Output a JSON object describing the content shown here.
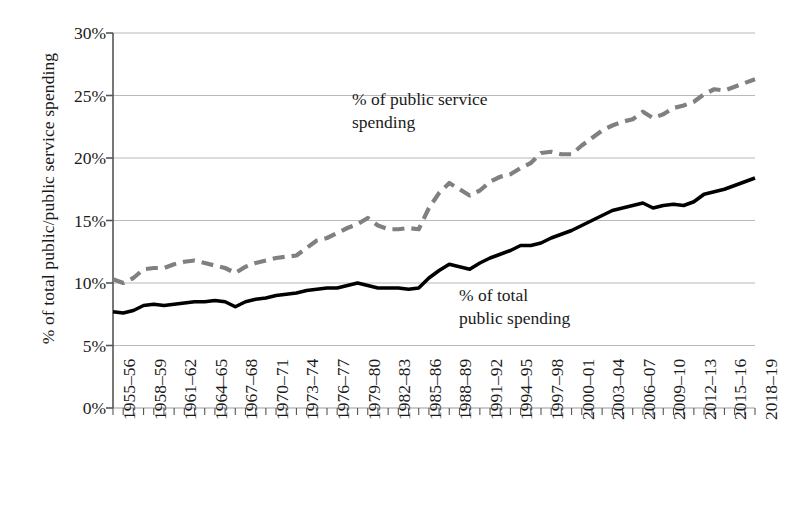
{
  "chart_data": {
    "type": "line",
    "title": "",
    "subtitle": "",
    "xlabel": "",
    "ylabel": "% of total public/public service spending",
    "ylim": [
      0,
      30
    ],
    "y_tick_labels": [
      "0%",
      "5%",
      "10%",
      "15%",
      "20%",
      "25%",
      "30%"
    ],
    "y_tick_values": [
      0,
      5,
      10,
      15,
      20,
      25,
      30
    ],
    "grid": "horizontal",
    "legend_position": "inline-annotations",
    "x_tick_labels": [
      "1955–56",
      "1958–59",
      "1961–62",
      "1964–65",
      "1967–68",
      "1970–71",
      "1973–74",
      "1976–77",
      "1979–80",
      "1982–83",
      "1985–86",
      "1988–89",
      "1991–92",
      "1994–95",
      "1997–98",
      "2000–01",
      "2003–04",
      "2006–07",
      "2009–10",
      "2012–13",
      "2015–16",
      "2018–19"
    ],
    "x_tick_indices": [
      0,
      3,
      6,
      9,
      12,
      15,
      18,
      21,
      24,
      27,
      30,
      33,
      36,
      39,
      42,
      45,
      48,
      51,
      54,
      57,
      60,
      63
    ],
    "x": [
      "1955-56",
      "1956-57",
      "1957-58",
      "1958-59",
      "1959-60",
      "1960-61",
      "1961-62",
      "1962-63",
      "1963-64",
      "1964-65",
      "1965-66",
      "1966-67",
      "1967-68",
      "1968-69",
      "1969-70",
      "1970-71",
      "1971-72",
      "1972-73",
      "1973-74",
      "1974-75",
      "1975-76",
      "1976-77",
      "1977-78",
      "1978-79",
      "1979-80",
      "1980-81",
      "1981-82",
      "1982-83",
      "1983-84",
      "1984-85",
      "1985-86",
      "1986-87",
      "1987-88",
      "1988-89",
      "1989-90",
      "1990-91",
      "1991-92",
      "1992-93",
      "1993-94",
      "1994-95",
      "1995-96",
      "1996-97",
      "1997-98",
      "1998-99",
      "1999-00",
      "2000-01",
      "2001-02",
      "2002-03",
      "2003-04",
      "2004-05",
      "2005-06",
      "2006-07",
      "2007-08",
      "2008-09",
      "2009-10",
      "2010-11",
      "2011-12",
      "2012-13",
      "2013-14",
      "2014-15",
      "2015-16",
      "2016-17",
      "2017-18",
      "2018-19"
    ],
    "series": [
      {
        "name": "% of public service spending",
        "style": "dashed",
        "color": "#808080",
        "values": [
          10.3,
          10.0,
          10.4,
          11.1,
          11.2,
          11.2,
          11.5,
          11.7,
          11.8,
          11.6,
          11.4,
          11.2,
          10.8,
          11.3,
          11.6,
          11.8,
          12.0,
          12.1,
          12.2,
          12.8,
          13.4,
          13.6,
          14.0,
          14.4,
          14.7,
          15.2,
          14.6,
          14.3,
          14.3,
          14.4,
          14.3,
          16.0,
          17.2,
          18.0,
          17.5,
          17.0,
          17.4,
          18.1,
          18.5,
          18.7,
          19.2,
          19.6,
          20.4,
          20.5,
          20.3,
          20.3,
          21.0,
          21.6,
          22.2,
          22.6,
          22.9,
          23.1,
          23.7,
          23.2,
          23.5,
          24.0,
          24.2,
          24.5,
          25.1,
          25.5,
          25.4,
          25.7,
          26.0,
          26.3
        ]
      },
      {
        "name": "% of total public spending",
        "style": "solid",
        "color": "#000000",
        "values": [
          7.7,
          7.6,
          7.8,
          8.2,
          8.3,
          8.2,
          8.3,
          8.4,
          8.5,
          8.5,
          8.6,
          8.5,
          8.1,
          8.5,
          8.7,
          8.8,
          9.0,
          9.1,
          9.2,
          9.4,
          9.5,
          9.6,
          9.6,
          9.8,
          10.0,
          9.8,
          9.6,
          9.6,
          9.6,
          9.5,
          9.6,
          10.4,
          11.0,
          11.5,
          11.3,
          11.1,
          11.6,
          12.0,
          12.3,
          12.6,
          13.0,
          13.0,
          13.2,
          13.6,
          13.9,
          14.2,
          14.6,
          15.0,
          15.4,
          15.8,
          16.0,
          16.2,
          16.4,
          16.0,
          16.2,
          16.3,
          16.2,
          16.5,
          17.1,
          17.3,
          17.5,
          17.8,
          18.1,
          18.4
        ]
      }
    ],
    "annotations": [
      {
        "id": "annot-public-service",
        "line1": "% of public service",
        "line2": "spending"
      },
      {
        "id": "annot-total-public",
        "line1": "% of total",
        "line2": "public spending"
      }
    ]
  }
}
